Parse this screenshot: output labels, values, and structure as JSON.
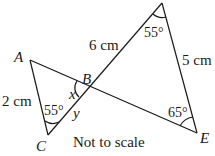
{
  "diagram": {
    "type": "geometry",
    "vertices": {
      "A": {
        "label": "A"
      },
      "B": {
        "label": "B"
      },
      "C": {
        "label": "C"
      },
      "D": {
        "label": "D"
      },
      "E": {
        "label": "E"
      }
    },
    "lengths": {
      "AC": "2 cm",
      "BD": "6 cm",
      "DE": "5 cm"
    },
    "angles": {
      "C": "55°",
      "D": "55°",
      "E": "65°",
      "x": "x",
      "y": "y"
    },
    "note": "Not to scale"
  }
}
